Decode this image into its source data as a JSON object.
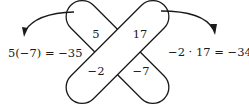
{
  "diagram": {
    "entries": {
      "top_left": "5",
      "top_right": "17",
      "bottom_left": "−2",
      "bottom_right": "−7"
    },
    "left_product": "5(−7) = −35",
    "right_product": "−2 · 17 = −34",
    "stroke_color": "#1a1a1a",
    "fill_color": "#ffffff"
  }
}
